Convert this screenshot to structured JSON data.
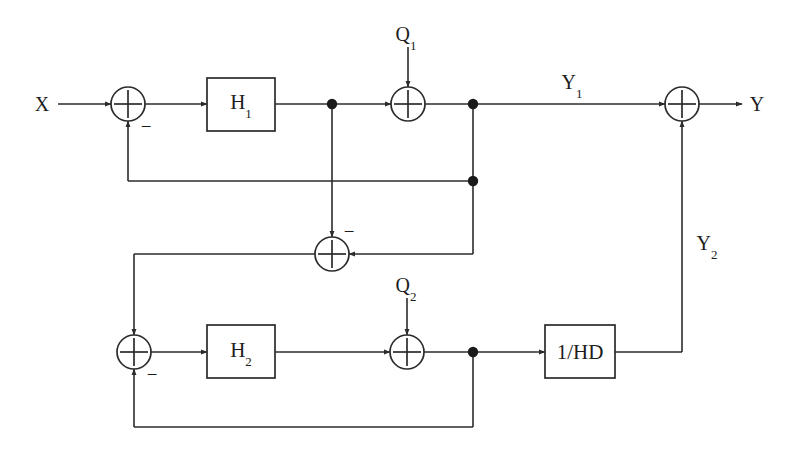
{
  "diagram": {
    "type": "block-diagram",
    "canvas": {
      "width": 794,
      "height": 451,
      "background": "#ffffff"
    },
    "line_color": "#2b2b2b",
    "text_color": "#1c1c1c"
  },
  "labels": {
    "input_x": "X",
    "output_y": "Y",
    "stage1_output": "Y",
    "stage1_output_sub": "1",
    "stage2_output": "Y",
    "stage2_output_sub": "2",
    "noise_q1": "Q",
    "noise_q1_sub": "1",
    "noise_q2": "Q",
    "noise_q2_sub": "2",
    "minus_sign": "−"
  },
  "blocks": [
    {
      "id": "h1",
      "label": "H",
      "sublabel": "1",
      "x": 207,
      "y": 78,
      "w": 68,
      "h": 53
    },
    {
      "id": "h2",
      "label": "H",
      "sublabel": "2",
      "x": 207,
      "y": 325,
      "w": 68,
      "h": 53
    },
    {
      "id": "invhd",
      "label": "1/HD",
      "sublabel": "",
      "x": 545,
      "y": 325,
      "w": 70,
      "h": 53
    }
  ],
  "summers": [
    {
      "id": "sum-input",
      "cx": 128,
      "cy": 104,
      "r": 17
    },
    {
      "id": "sum-q1",
      "cx": 408,
      "cy": 104,
      "r": 17
    },
    {
      "id": "sum-output",
      "cx": 682,
      "cy": 104,
      "r": 17
    },
    {
      "id": "sum-mid",
      "cx": 332,
      "cy": 254,
      "r": 17
    },
    {
      "id": "sum-stage2-input",
      "cx": 134,
      "cy": 352,
      "r": 17
    },
    {
      "id": "sum-q2",
      "cx": 407,
      "cy": 352,
      "r": 17
    }
  ],
  "nodes": [
    {
      "id": "node-h1-out",
      "cx": 332,
      "cy": 104
    },
    {
      "id": "node-y1",
      "cx": 473,
      "cy": 104
    },
    {
      "id": "node-fb1",
      "cx": 473,
      "cy": 181
    },
    {
      "id": "node-q2-out",
      "cx": 473,
      "cy": 352
    }
  ],
  "sign_markers": [
    {
      "id": "minus-input-summer",
      "x": 146,
      "y": 126
    },
    {
      "id": "minus-mid-summer",
      "x": 349,
      "y": 231
    },
    {
      "id": "minus-stage2-summer",
      "x": 152,
      "y": 374
    }
  ],
  "label_positions": {
    "input_x": {
      "x": 42,
      "y": 104
    },
    "output_y": {
      "x": 757,
      "y": 104
    },
    "stage1_output": {
      "x": 572,
      "y": 84
    },
    "stage2_output": {
      "x": 707,
      "y": 245
    },
    "noise_q1": {
      "x": 406,
      "y": 36
    },
    "noise_q2": {
      "x": 406,
      "y": 287
    }
  }
}
